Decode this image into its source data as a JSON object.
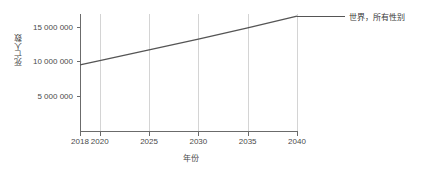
{
  "chart_data": {
    "type": "line",
    "title": "",
    "xlabel": "年份",
    "ylabel": "死亡人数",
    "x": [
      2018,
      2020,
      2025,
      2030,
      2035,
      2040
    ],
    "series": [
      {
        "name": "世界，所有性别",
        "values": [
          9500000,
          10100000,
          11650000,
          13200000,
          14800000,
          16500000
        ],
        "color": "#555555",
        "style": "solid"
      }
    ],
    "xlim": [
      2018,
      2040
    ],
    "ylim": [
      0,
      16800000
    ],
    "xticks": [
      2018,
      2020,
      2025,
      2030,
      2035,
      2040
    ],
    "xtick_labels": [
      "2018",
      "2020",
      "2025",
      "2030",
      "2035",
      "2040"
    ],
    "yticks": [
      5000000,
      10000000,
      15000000
    ],
    "ytick_labels": [
      "5 000 000",
      "10 000 000",
      "15 000 000"
    ],
    "grid": "vertical",
    "legend_position": "right"
  },
  "legend": {
    "entries": [
      {
        "label": "世界，所有性别"
      }
    ]
  },
  "axes": {
    "x_title": "年份",
    "y_title": "死亡人数"
  }
}
